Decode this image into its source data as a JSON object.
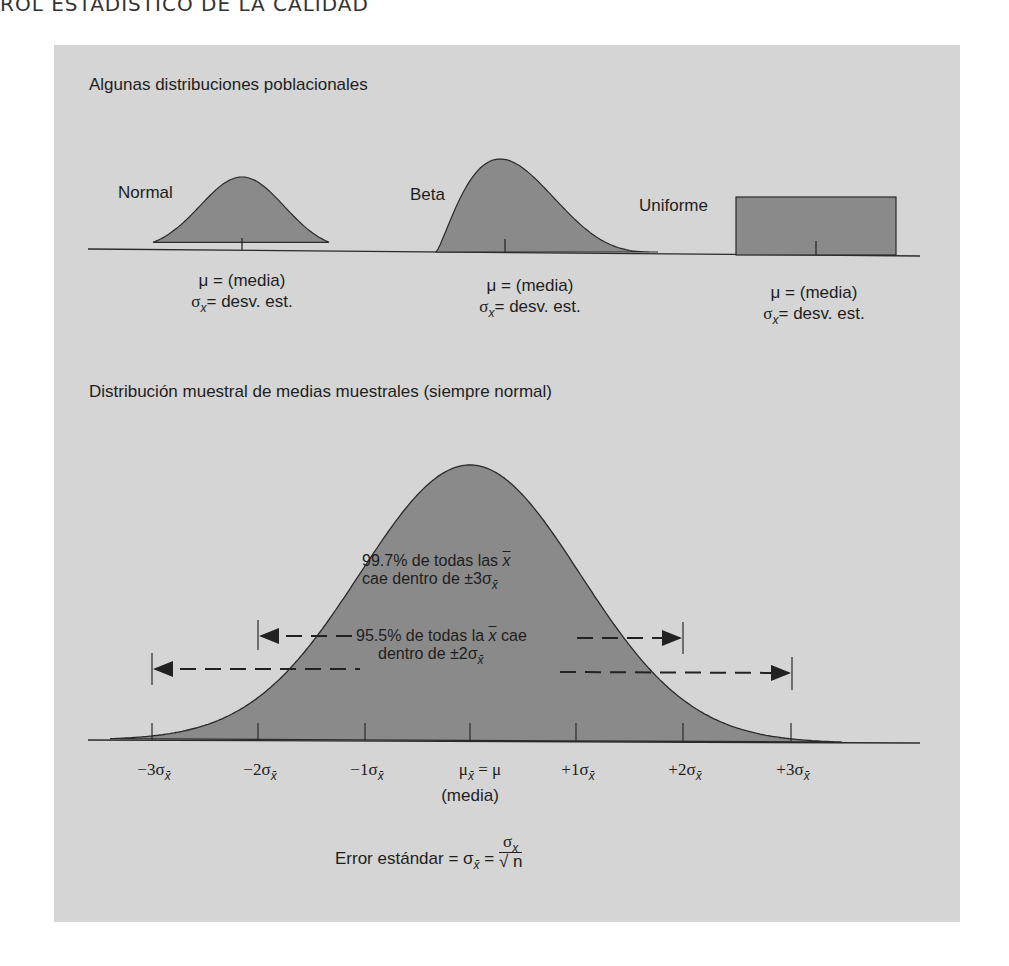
{
  "page_header": "ROL ESTADÍSTICO DE LA CALIDAD",
  "top_panel": {
    "title": "Algunas distribuciones poblacionales",
    "distributions": [
      {
        "name": "Normal",
        "mu_label": "μ = (media)",
        "sigma_label": "= desv. est."
      },
      {
        "name": "Beta",
        "mu_label": "μ = (media)",
        "sigma_label": "= desv. est."
      },
      {
        "name": "Uniforme",
        "mu_label": "μ = (media)",
        "sigma_label": "= desv. est."
      }
    ],
    "sigma_symbol": "σ",
    "sigma_sub": "x"
  },
  "bottom_panel": {
    "title": "Distribución muestral de medias muestrales (siempre normal)",
    "annotation_3sigma": {
      "line1": "99.7% de todas las ",
      "xbar": "x",
      "line2": "cae dentro de ±3σ",
      "sub": "x̄"
    },
    "annotation_2sigma": {
      "line1a": "95.5% de todas la ",
      "xbar": "x",
      "line1b": " cae",
      "line2": "dentro de ±2σ",
      "sub": "x̄"
    },
    "axis_labels": [
      "−3σ",
      "−2σ",
      "−1σ",
      "μ",
      "+1σ",
      "+2σ",
      "+3σ"
    ],
    "axis_sub": "x̄",
    "mean_label_suffix": " = μ",
    "mean_caption": "(media)",
    "standard_error": {
      "prefix": "Error estándar = σ",
      "sub": "x̄",
      "eq": " = ",
      "num": "σ",
      "num_sub": "x",
      "den": "√ n"
    }
  },
  "colors": {
    "panel_bg": "#d5d5d5",
    "fill": "#8a8a8a",
    "stroke": "#2a2a2a"
  },
  "chart_data": {
    "type": "area",
    "title": "Distribución muestral de medias muestrales (siempre normal)",
    "x": [
      -3,
      -2,
      -1,
      0,
      1,
      2,
      3
    ],
    "tick_labels": [
      "−3σx̄",
      "−2σx̄",
      "−1σx̄",
      "μx̄ = μ (media)",
      "+1σx̄",
      "+2σx̄",
      "+3σx̄"
    ],
    "annotations": [
      "99.7% de todas las x̄ cae dentro de ±3σx̄",
      "95.5% de todas la x̄ cae dentro de ±2σx̄",
      "Error estándar = σx̄ = σx / √n"
    ],
    "subplots": [
      "Normal",
      "Beta",
      "Uniforme"
    ]
  }
}
